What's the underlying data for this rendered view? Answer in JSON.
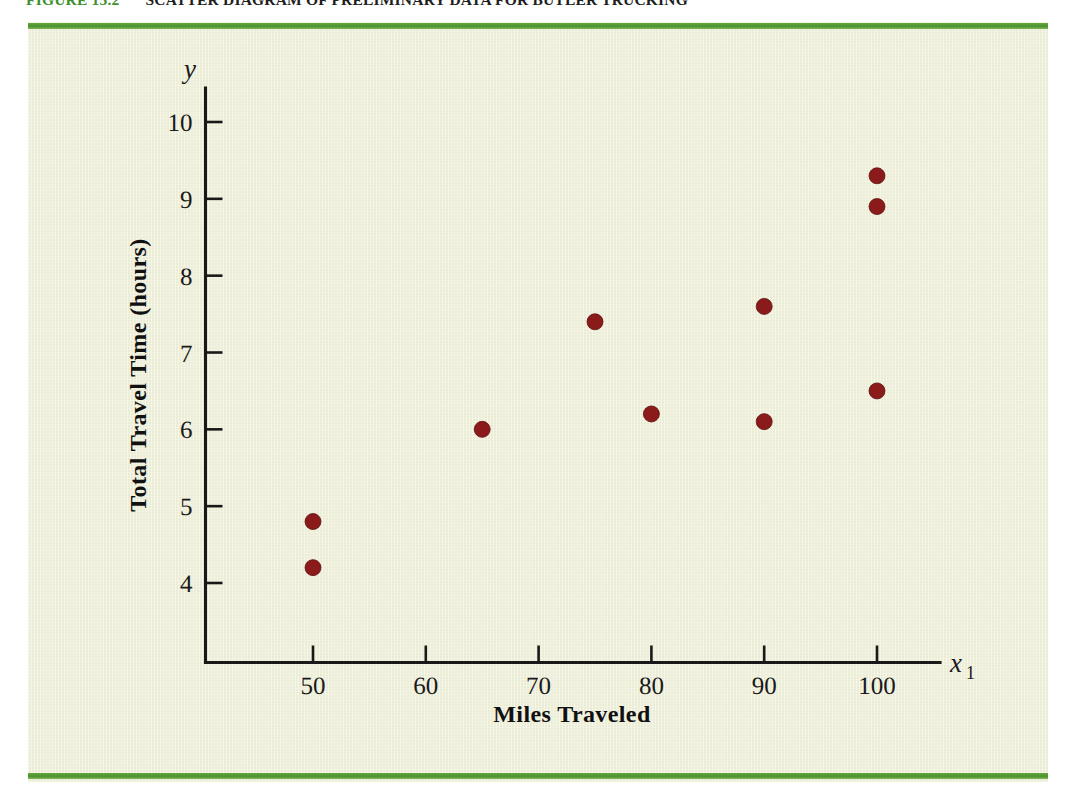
{
  "figure": {
    "label": "FIGURE 15.2",
    "title": "SCATTER DIAGRAM OF PRELIMINARY DATA FOR BUTLER TRUCKING",
    "label_color": "#3f8f2f",
    "rule_color": "#4d9130",
    "panel_color": "#f2f3df"
  },
  "chart_data": {
    "type": "scatter",
    "title": "SCATTER DIAGRAM OF PRELIMINARY DATA FOR BUTLER TRUCKING",
    "xlabel": "Miles Traveled",
    "ylabel": "Total Travel Time (hours)",
    "x_axis_variable": "x",
    "x_axis_variable_subscript": "1",
    "y_axis_variable": "y",
    "xlim": [
      44,
      106
    ],
    "ylim": [
      3.0,
      10.6
    ],
    "xticks": [
      50,
      60,
      70,
      80,
      90,
      100
    ],
    "yticks": [
      4,
      5,
      6,
      7,
      8,
      9,
      10
    ],
    "xtick_labels": [
      "50",
      "60",
      "70",
      "80",
      "90",
      "100"
    ],
    "ytick_labels": [
      "4",
      "5",
      "6",
      "7",
      "8",
      "9",
      "10"
    ],
    "grid": false,
    "legend": null,
    "marker_color": "#8b1a1a",
    "marker_radius_px": 8,
    "points": [
      {
        "x": 50,
        "y": 4.2
      },
      {
        "x": 50,
        "y": 4.8
      },
      {
        "x": 65,
        "y": 6.0
      },
      {
        "x": 75,
        "y": 7.4
      },
      {
        "x": 80,
        "y": 6.2
      },
      {
        "x": 90,
        "y": 6.1
      },
      {
        "x": 90,
        "y": 7.6
      },
      {
        "x": 100,
        "y": 6.5
      },
      {
        "x": 100,
        "y": 8.9
      },
      {
        "x": 100,
        "y": 9.3
      }
    ]
  }
}
